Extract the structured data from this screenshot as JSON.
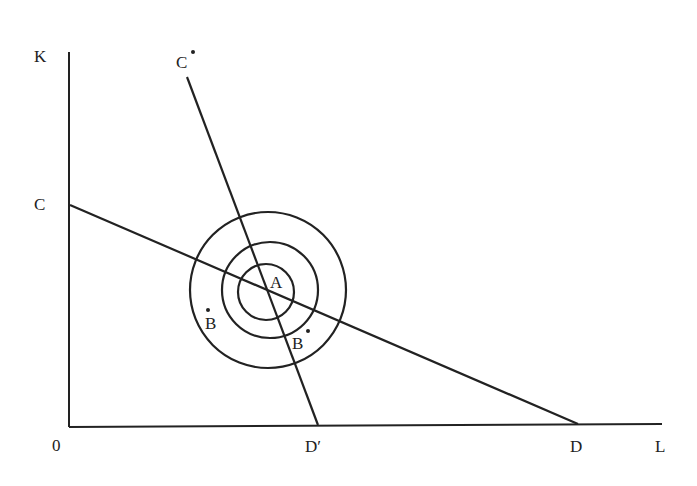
{
  "diagram": {
    "axes": {
      "y_label": "K",
      "x_label": "L",
      "origin_label": "0"
    },
    "lines": [
      {
        "name": "CD",
        "start_label": "C",
        "end_label": "D"
      },
      {
        "name": "C*D'",
        "start_label": "C*",
        "end_label": "D′"
      }
    ],
    "points": {
      "center": "A",
      "left_point": "B",
      "right_point": "B"
    },
    "rings": {
      "count": 3
    }
  }
}
